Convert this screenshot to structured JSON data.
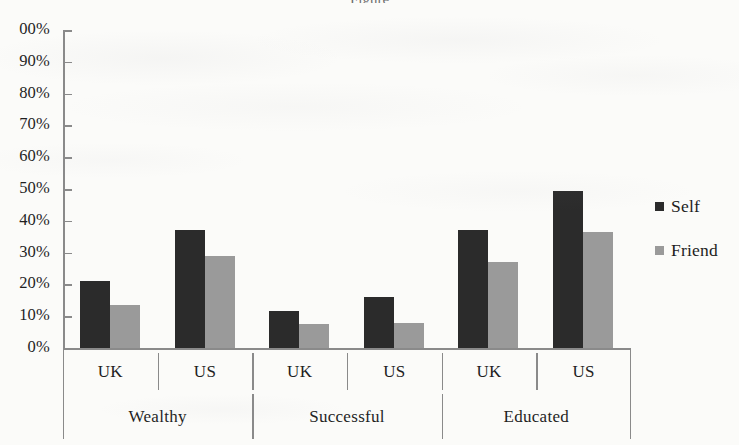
{
  "figure": {
    "cropped_title_fragment": "Figure"
  },
  "legend": {
    "position": "right",
    "entries": [
      {
        "label": "Self",
        "color": "#2b2b2b",
        "swatch": "square-swatch-self"
      },
      {
        "label": "Friend",
        "color": "#9a9a9a",
        "swatch": "square-swatch-friend"
      }
    ]
  },
  "axis": {
    "y_ticks": [
      "100%",
      "90%",
      "80%",
      "70%",
      "60%",
      "50%",
      "40%",
      "30%",
      "20%",
      "10%",
      "0%"
    ],
    "y_tick_top_clipped_text": "00%",
    "x_inner_labels": [
      "UK",
      "US",
      "UK",
      "US",
      "UK",
      "US"
    ],
    "x_outer_labels": [
      "Wealthy",
      "Successful",
      "Educated"
    ]
  },
  "chart_data": {
    "type": "bar",
    "title": "",
    "xlabel": "",
    "ylabel": "",
    "ylim": [
      0,
      100
    ],
    "ytick_step": 10,
    "grid": false,
    "legend_position": "right",
    "value_unit": "%",
    "groups": [
      "Wealthy",
      "Successful",
      "Educated"
    ],
    "subcategories": [
      "UK",
      "US"
    ],
    "categories": [
      "Wealthy UK",
      "Wealthy US",
      "Successful UK",
      "Successful US",
      "Educated UK",
      "Educated US"
    ],
    "series": [
      {
        "name": "Self",
        "color": "#2b2b2b",
        "values": [
          21,
          37,
          11.5,
          16,
          37,
          49.5
        ]
      },
      {
        "name": "Friend",
        "color": "#9a9a9a",
        "values": [
          13.5,
          29,
          7.5,
          8,
          27,
          36.5
        ]
      }
    ]
  }
}
